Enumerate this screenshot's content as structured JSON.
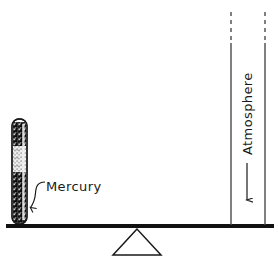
{
  "figure": {
    "width": 278,
    "height": 261,
    "background_color": "#ffffff",
    "ink_color": "#1a1a1a"
  },
  "labels": {
    "mercury": "Mercury",
    "atmosphere": "Atmosphere"
  },
  "elements": {
    "mercury_tube": {
      "name": "mercury-tube",
      "x": 12,
      "y": 119,
      "width": 15,
      "height": 105,
      "fill_color": "#2b2b2b",
      "outline_color": "#1a1a1a",
      "corner_radius": 7
    },
    "mercury_leader_line": {
      "name": "mercury-leader-line",
      "from_x": 44,
      "from_y": 183,
      "to_x": 29,
      "to_y": 209,
      "arrow": true
    },
    "mercury_label_position": {
      "x": 46,
      "y": 191
    },
    "ground_line": {
      "name": "ground-line",
      "x1": 6,
      "y1": 226,
      "x2": 274,
      "y2": 226,
      "thickness": 4,
      "color": "#111111"
    },
    "fulcrum_triangle": {
      "name": "fulcrum-triangle",
      "apex_x": 137,
      "apex_y": 229,
      "left_x": 113,
      "right_x": 161,
      "base_y": 255,
      "color": "#1a1a1a",
      "filled": false
    },
    "atmosphere_column_left_line": {
      "name": "atmosphere-column-left-line",
      "x": 231,
      "dash_top_y": 12,
      "dash_bottom_y": 43,
      "solid_bottom_y": 225,
      "color": "#4a4a4a"
    },
    "atmosphere_column_right_line": {
      "name": "atmosphere-column-right-line",
      "x": 265,
      "dash_top_y": 12,
      "dash_bottom_y": 43,
      "solid_bottom_y": 225,
      "color": "#4a4a4a"
    },
    "atmosphere_arrow": {
      "name": "atmosphere-down-arrow",
      "x": 247,
      "top_y": 163,
      "bottom_y": 206,
      "color": "#1a1a1a",
      "direction": "down"
    },
    "atmosphere_label_position": {
      "x": 252,
      "y": 155,
      "rotation_degrees": -90
    }
  }
}
